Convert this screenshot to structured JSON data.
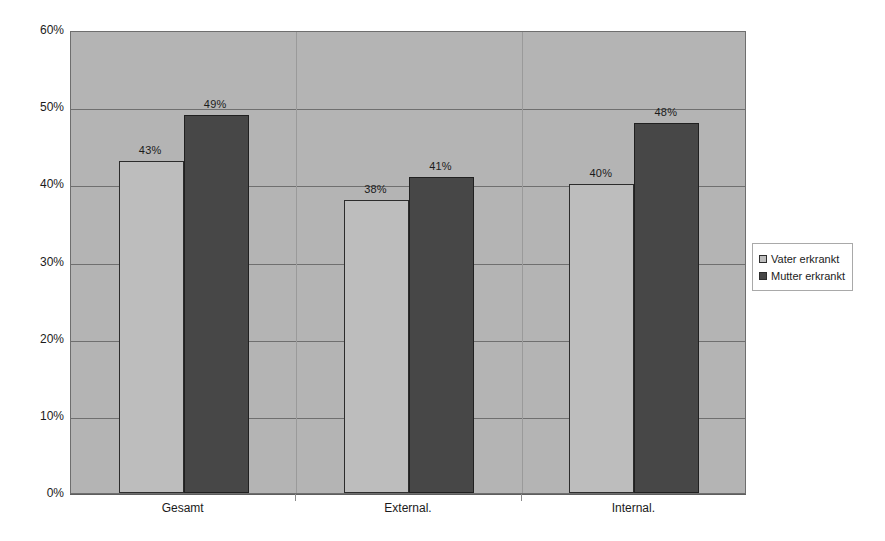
{
  "chart_data": {
    "type": "bar",
    "title": "",
    "subtitle": "",
    "xlabel": "",
    "ylabel": "",
    "categories": [
      "Gesamt",
      "External.",
      "Internal."
    ],
    "series": [
      {
        "name": "Vater erkrankt",
        "values": [
          43,
          38,
          40
        ],
        "color": "#bdbdbd"
      },
      {
        "name": "Mutter erkrankt",
        "values": [
          49,
          41,
          48
        ],
        "color": "#474747"
      }
    ],
    "value_labels": [
      [
        "43%",
        "38%",
        "40%"
      ],
      [
        "49%",
        "41%",
        "48%"
      ]
    ],
    "ylim": [
      0,
      60
    ],
    "ytick_values": [
      0,
      10,
      20,
      30,
      40,
      50,
      60
    ],
    "ytick_labels": [
      "0%",
      "10%",
      "20%",
      "30%",
      "40%",
      "50%",
      "60%"
    ],
    "grid": true,
    "grid_axis": "y",
    "legend_position": "right",
    "plot_background": "#b4b4b4",
    "page_background": "#ffffff",
    "value_suffix": "%"
  }
}
